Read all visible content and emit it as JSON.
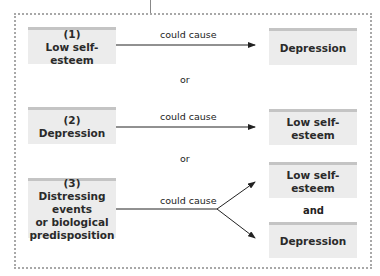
{
  "diagram": {
    "scenarios": [
      {
        "cause": {
          "number": "(1)",
          "lines": [
            "Low self-esteem"
          ]
        },
        "relation": "could cause",
        "effects": [
          "Depression"
        ]
      },
      {
        "cause": {
          "number": "(2)",
          "lines": [
            "Depression"
          ]
        },
        "relation": "could cause",
        "effects": [
          "Low self-esteem"
        ]
      },
      {
        "cause": {
          "number": "(3)",
          "lines": [
            "Distressing events",
            "or biological",
            "predisposition"
          ]
        },
        "relation": "could cause",
        "effects": [
          "Low self-esteem",
          "Depression"
        ],
        "effects_joiner": "and"
      }
    ],
    "separators": [
      "or",
      "or"
    ],
    "colors": {
      "box_fill": "#ececec",
      "box_top_bar": "#c4c4c4",
      "frame_dots": "#a8a8a8",
      "arrow": "#222222"
    }
  }
}
